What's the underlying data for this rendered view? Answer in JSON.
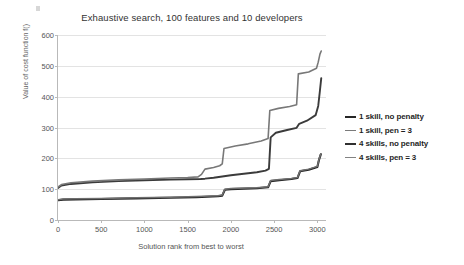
{
  "chart_data": {
    "type": "line",
    "title": "Exhaustive search, 100 features and 10 developers",
    "xlabel": "Solution rank from best to worst",
    "ylabel": "Value of cost function f()",
    "xlim": [
      0,
      3100
    ],
    "ylim": [
      0,
      600
    ],
    "xticks": [
      0,
      500,
      1000,
      1500,
      2000,
      2500,
      3000
    ],
    "yticks": [
      0,
      100,
      200,
      300,
      400,
      500,
      600
    ],
    "grid": true,
    "legend_position": "right",
    "series": [
      {
        "name": "1 skill, no penalty",
        "color": "#262626",
        "width": 2.1,
        "points": [
          [
            0,
            64
          ],
          [
            60,
            66
          ],
          [
            200,
            67
          ],
          [
            500,
            68
          ],
          [
            900,
            70
          ],
          [
            1300,
            72
          ],
          [
            1600,
            74
          ],
          [
            1850,
            77
          ],
          [
            1900,
            79
          ],
          [
            1930,
            98
          ],
          [
            2000,
            100
          ],
          [
            2300,
            103
          ],
          [
            2430,
            106
          ],
          [
            2460,
            126
          ],
          [
            2560,
            129
          ],
          [
            2700,
            133
          ],
          [
            2770,
            136
          ],
          [
            2800,
            158
          ],
          [
            2900,
            163
          ],
          [
            3000,
            172
          ],
          [
            3020,
            196
          ],
          [
            3040,
            213
          ]
        ]
      },
      {
        "name": "1 skill, pen = 3",
        "color": "#6e6e6e",
        "width": 1.5,
        "points": [
          [
            0,
            66
          ],
          [
            60,
            68
          ],
          [
            200,
            69
          ],
          [
            500,
            70
          ],
          [
            900,
            72
          ],
          [
            1300,
            74
          ],
          [
            1600,
            76
          ],
          [
            1850,
            79
          ],
          [
            1900,
            81
          ],
          [
            1930,
            100
          ],
          [
            2000,
            102
          ],
          [
            2300,
            105
          ],
          [
            2430,
            108
          ],
          [
            2460,
            128
          ],
          [
            2560,
            131
          ],
          [
            2700,
            135
          ],
          [
            2770,
            138
          ],
          [
            2800,
            160
          ],
          [
            2900,
            165
          ],
          [
            3000,
            174
          ],
          [
            3020,
            198
          ],
          [
            3040,
            215
          ]
        ]
      },
      {
        "name": "4 skills, no penalty",
        "color": "#3b3b3b",
        "width": 1.9,
        "points": [
          [
            0,
            104
          ],
          [
            40,
            112
          ],
          [
            150,
            117
          ],
          [
            400,
            122
          ],
          [
            700,
            126
          ],
          [
            1000,
            129
          ],
          [
            1300,
            131
          ],
          [
            1500,
            132
          ],
          [
            1650,
            133
          ],
          [
            1700,
            134
          ],
          [
            1800,
            137
          ],
          [
            1900,
            141
          ],
          [
            2000,
            145
          ],
          [
            2150,
            150
          ],
          [
            2300,
            155
          ],
          [
            2400,
            160
          ],
          [
            2440,
            166
          ],
          [
            2460,
            268
          ],
          [
            2520,
            283
          ],
          [
            2650,
            292
          ],
          [
            2760,
            299
          ],
          [
            2790,
            312
          ],
          [
            2880,
            322
          ],
          [
            2980,
            340
          ],
          [
            3010,
            370
          ],
          [
            3030,
            420
          ],
          [
            3045,
            460
          ]
        ]
      },
      {
        "name": "4 skills, pen = 3",
        "color": "#787878",
        "width": 1.6,
        "points": [
          [
            0,
            107
          ],
          [
            40,
            115
          ],
          [
            150,
            121
          ],
          [
            400,
            126
          ],
          [
            700,
            130
          ],
          [
            1000,
            133
          ],
          [
            1300,
            136
          ],
          [
            1500,
            138
          ],
          [
            1620,
            140
          ],
          [
            1660,
            148
          ],
          [
            1700,
            165
          ],
          [
            1800,
            170
          ],
          [
            1870,
            176
          ],
          [
            1900,
            182
          ],
          [
            1920,
            232
          ],
          [
            2050,
            240
          ],
          [
            2200,
            247
          ],
          [
            2350,
            256
          ],
          [
            2430,
            264
          ],
          [
            2450,
            355
          ],
          [
            2550,
            362
          ],
          [
            2680,
            368
          ],
          [
            2760,
            374
          ],
          [
            2780,
            474
          ],
          [
            2900,
            480
          ],
          [
            2990,
            492
          ],
          [
            3010,
            512
          ],
          [
            3030,
            538
          ],
          [
            3045,
            548
          ]
        ]
      }
    ]
  },
  "legend": {
    "items": [
      {
        "label": "1 skill, no penalty",
        "color": "#262626",
        "thickness": "2.6px"
      },
      {
        "label": "1 skill, pen = 3",
        "color": "#7a7a7a",
        "thickness": "1.8px"
      },
      {
        "label": "4 skills, no penalty",
        "color": "#303030",
        "thickness": "2.4px"
      },
      {
        "label": "4 skills, pen = 3",
        "color": "#828282",
        "thickness": "1.8px"
      }
    ]
  }
}
